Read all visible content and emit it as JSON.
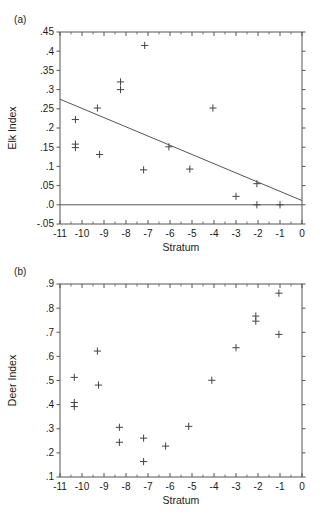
{
  "figure": {
    "panels": [
      {
        "tag": "(a)",
        "xlabel": "Stratum",
        "ylabel": "Elk Index"
      },
      {
        "tag": "(b)",
        "xlabel": "Stratum",
        "ylabel": "Deer Index"
      }
    ],
    "colors": {
      "ink": "#1a1a1a",
      "axis": "#555555",
      "marker": "#444444",
      "trendline": "#555555"
    }
  },
  "chart_data": [
    {
      "type": "scatter",
      "panel": "(a)",
      "title": "",
      "xlabel": "Stratum",
      "ylabel": "Elk Index",
      "xlim": [
        -11,
        0
      ],
      "ylim": [
        -0.05,
        0.45
      ],
      "xticks": [
        -11,
        -10,
        -9,
        -8,
        -7,
        -6,
        -5,
        -4,
        -3,
        -2,
        -1,
        0
      ],
      "xticklabels": [
        "-11",
        "-10",
        "-9",
        "-8",
        "-7",
        "-6",
        "-5",
        "-4",
        "-3",
        "-2",
        "-1",
        "0"
      ],
      "yticks": [
        -0.05,
        0.0,
        0.05,
        0.1,
        0.15,
        0.2,
        0.25,
        0.3,
        0.35,
        0.4,
        0.45
      ],
      "yticklabels": [
        "-.05",
        ".0",
        ".05",
        ".1",
        ".15",
        ".2",
        ".25",
        ".3",
        ".35",
        ".4",
        ".45"
      ],
      "grid": false,
      "legend": null,
      "marker": "plus",
      "points": [
        {
          "x": -10.3,
          "y": 0.222
        },
        {
          "x": -10.3,
          "y": 0.158
        },
        {
          "x": -10.3,
          "y": 0.149
        },
        {
          "x": -9.3,
          "y": 0.252
        },
        {
          "x": -9.2,
          "y": 0.131
        },
        {
          "x": -8.25,
          "y": 0.32
        },
        {
          "x": -8.25,
          "y": 0.3
        },
        {
          "x": -7.15,
          "y": 0.415
        },
        {
          "x": -7.2,
          "y": 0.091
        },
        {
          "x": -6.05,
          "y": 0.151
        },
        {
          "x": -5.1,
          "y": 0.093
        },
        {
          "x": -4.05,
          "y": 0.252
        },
        {
          "x": -3.0,
          "y": 0.022
        },
        {
          "x": -2.05,
          "y": 0.055
        },
        {
          "x": -2.05,
          "y": 0.0
        },
        {
          "x": -1.0,
          "y": 0.0
        }
      ],
      "trendline": {
        "x0": -11,
        "y0": 0.275,
        "x1": 0,
        "y1": 0.011
      },
      "reference_line": {
        "y": 0.0
      }
    },
    {
      "type": "scatter",
      "panel": "(b)",
      "title": "",
      "xlabel": "Stratum",
      "ylabel": "Deer Index",
      "xlim": [
        -11,
        0
      ],
      "ylim": [
        0.1,
        0.9
      ],
      "xticks": [
        -11,
        -10,
        -9,
        -8,
        -7,
        -6,
        -5,
        -4,
        -3,
        -2,
        -1,
        0
      ],
      "xticklabels": [
        "-11",
        "-10",
        "-9",
        "-8",
        "-7",
        "-6",
        "-5",
        "-4",
        "-3",
        "-2",
        "-1",
        "0"
      ],
      "yticks": [
        0.1,
        0.2,
        0.3,
        0.4,
        0.5,
        0.6,
        0.7,
        0.8,
        0.9
      ],
      "yticklabels": [
        ".1",
        ".2",
        ".3",
        ".4",
        ".5",
        ".6",
        ".7",
        ".8",
        ".9"
      ],
      "grid": false,
      "legend": null,
      "marker": "plus",
      "points": [
        {
          "x": -10.35,
          "y": 0.513
        },
        {
          "x": -10.35,
          "y": 0.409
        },
        {
          "x": -10.35,
          "y": 0.392
        },
        {
          "x": -9.3,
          "y": 0.622
        },
        {
          "x": -9.25,
          "y": 0.481
        },
        {
          "x": -8.3,
          "y": 0.306
        },
        {
          "x": -8.3,
          "y": 0.244
        },
        {
          "x": -7.2,
          "y": 0.261
        },
        {
          "x": -7.2,
          "y": 0.164
        },
        {
          "x": -6.2,
          "y": 0.228
        },
        {
          "x": -5.15,
          "y": 0.31
        },
        {
          "x": -4.1,
          "y": 0.501
        },
        {
          "x": -3.0,
          "y": 0.636
        },
        {
          "x": -2.1,
          "y": 0.767
        },
        {
          "x": -2.1,
          "y": 0.746
        },
        {
          "x": -1.05,
          "y": 0.862
        },
        {
          "x": -1.05,
          "y": 0.691
        }
      ]
    }
  ]
}
